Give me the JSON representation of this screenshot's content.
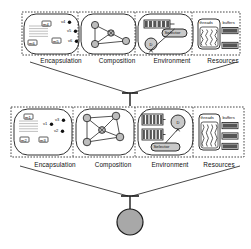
{
  "diagram": {
    "background": "#ffffff",
    "stroke_color": "#1a1a1a",
    "fill_light": "#f2f2f2",
    "fill_gray": "#a8a8a8",
    "fill_dark": "#555555"
  },
  "bands": [
    {
      "id": "band-top",
      "x": 22,
      "y": 12,
      "w": 218,
      "h": 43,
      "cells": [
        {
          "id": "cell-encapsulation-top",
          "label": "Encapsulation",
          "label_x": 61,
          "label_y": 57,
          "x": 24,
          "y": 14,
          "w": 55,
          "h": 40,
          "kind": "encapsulation",
          "methods": [
            {
              "name": "m4",
              "x": 18,
              "y": 7
            },
            {
              "name": "m5",
              "x": 28,
              "y": 24
            },
            {
              "name": "m6",
              "x": 4,
              "y": 26
            }
          ],
          "vars": [
            {
              "name": "v4",
              "x": 38,
              "y": 6
            },
            {
              "name": "v5",
              "x": 44,
              "y": 15
            },
            {
              "name": "v6",
              "x": 45,
              "y": 25
            }
          ]
        },
        {
          "id": "cell-composition-top",
          "label": "Composition",
          "label_x": 117,
          "label_y": 57,
          "x": 81,
          "y": 14,
          "w": 55,
          "h": 40,
          "kind": "composition",
          "nodes": [
            {
              "x": 14,
              "y": 11,
              "r": 3.6
            },
            {
              "x": 14,
              "y": 30,
              "r": 3.6
            },
            {
              "x": 45,
              "y": 27,
              "r": 3.6
            },
            {
              "x": 30,
              "y": 19,
              "r": 3.2
            }
          ],
          "center_index": 3
        },
        {
          "id": "cell-environment-top",
          "label": "Environment",
          "label_x": 172,
          "label_y": 57,
          "x": 138,
          "y": 14,
          "w": 55,
          "h": 40,
          "kind": "environment",
          "queues": [
            {
              "x": 6,
              "y": 6,
              "w": 26,
              "h": 8,
              "slots": 6
            }
          ],
          "dispatcher": {
            "label": "D",
            "cx": 13,
            "cy": 30,
            "r": 6
          },
          "selector": {
            "label": "Selector",
            "x": 24,
            "y": 15,
            "w": 25,
            "h": 8
          }
        },
        {
          "id": "cell-resources-top",
          "label": "Resources",
          "label_x": 223,
          "label_y": 57,
          "x": 195,
          "y": 14,
          "w": 47,
          "h": 40,
          "kind": "resources",
          "threads": {
            "label": "threads",
            "x": 3,
            "y": 5,
            "w": 22,
            "h": 30,
            "squiggles": 4
          },
          "buffers": {
            "label": "buffers",
            "x": 27,
            "y": 5,
            "w": 17,
            "h": 30,
            "count": 2
          }
        }
      ]
    },
    {
      "id": "band-middle",
      "x": 11,
      "y": 107,
      "w": 233,
      "h": 50,
      "cells": [
        {
          "id": "cell-encapsulation-middle",
          "label": "Encapsulation",
          "label_x": 55,
          "label_y": 161,
          "x": 14,
          "y": 109,
          "w": 58,
          "h": 46,
          "kind": "encapsulation",
          "methods": [
            {
              "name": "m1",
              "x": 10,
              "y": 5
            },
            {
              "name": "m2",
              "x": 6,
              "y": 28
            },
            {
              "name": "m3",
              "x": 25,
              "y": 28
            }
          ],
          "vars": [
            {
              "name": "v1",
              "x": 30,
              "y": 13
            },
            {
              "name": "v2",
              "x": 41,
              "y": 20
            },
            {
              "name": "v3",
              "x": 42,
              "y": 9
            }
          ]
        },
        {
          "id": "cell-composition-middle",
          "label": "Composition",
          "label_x": 113,
          "label_y": 161,
          "x": 76,
          "y": 109,
          "w": 58,
          "h": 46,
          "kind": "composition",
          "nodes": [
            {
              "x": 11,
              "y": 9,
              "r": 3.8
            },
            {
              "x": 40,
              "y": 7,
              "r": 3.8
            },
            {
              "x": 11,
              "y": 33,
              "r": 3.8
            },
            {
              "x": 44,
              "y": 28,
              "r": 3.8
            },
            {
              "x": 26,
              "y": 21,
              "r": 3.4
            }
          ],
          "center_index": 4
        },
        {
          "id": "cell-environment-middle",
          "label": "Environment",
          "label_x": 170,
          "label_y": 161,
          "x": 138,
          "y": 109,
          "w": 55,
          "h": 46,
          "kind": "environment",
          "queues": [
            {
              "x": 4,
              "y": 5,
              "w": 21,
              "h": 11,
              "slots": 6
            },
            {
              "x": 4,
              "y": 20,
              "w": 21,
              "h": 11,
              "slots": 6
            }
          ],
          "dispatcher": {
            "label": "D",
            "cx": 40,
            "cy": 13,
            "r": 7
          },
          "selector": {
            "label": "Selector",
            "x": 13,
            "y": 34,
            "w": 29,
            "h": 8
          }
        },
        {
          "id": "cell-resources-middle",
          "label": "Resources",
          "label_x": 219,
          "label_y": 161,
          "x": 196,
          "y": 109,
          "w": 46,
          "h": 46,
          "kind": "resources",
          "threads": {
            "label": "threads",
            "x": 3,
            "y": 5,
            "w": 21,
            "h": 36,
            "squiggles": 4
          },
          "buffers": {
            "label": "buffers",
            "x": 26,
            "y": 5,
            "w": 17,
            "h": 36,
            "count": 3
          }
        }
      ]
    }
  ],
  "connectors": [
    {
      "id": "connector-top-to-middle",
      "left_x": 30,
      "left_y": 62,
      "right_x": 237,
      "right_y": 62,
      "apex_x": 130,
      "apex_y": 93,
      "bar_half_width": 8,
      "stem_bottom_y": 106
    },
    {
      "id": "connector-middle-to-instance",
      "left_x": 20,
      "left_y": 166,
      "right_x": 240,
      "right_y": 166,
      "apex_x": 130,
      "apex_y": 196,
      "bar_half_width": 9,
      "stem_bottom_y": 209
    }
  ],
  "instance": {
    "id": "instance-node",
    "cx": 130,
    "cy": 222,
    "r": 13,
    "fill": "#a8a8a8"
  }
}
